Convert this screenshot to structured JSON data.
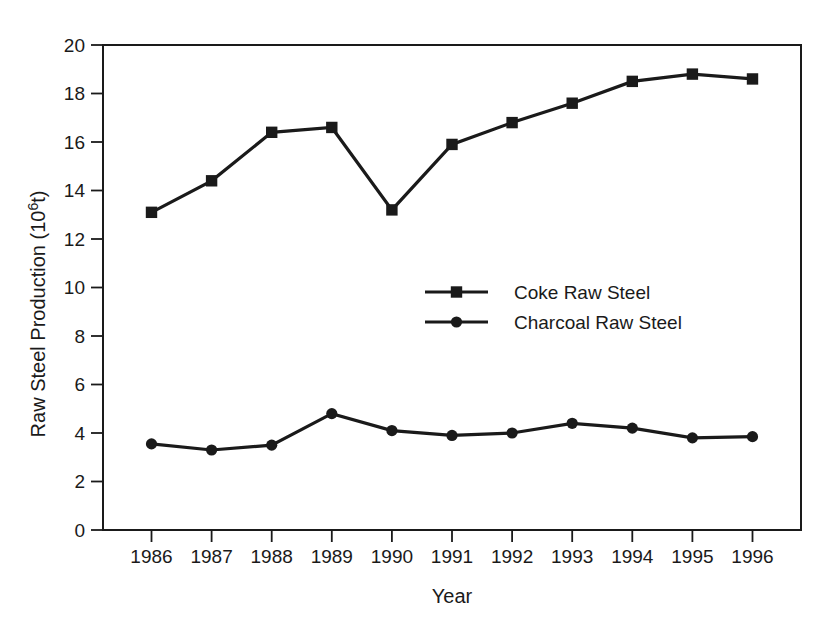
{
  "figure": {
    "background": "#ffffff",
    "ink_color": "#1a1a1a"
  },
  "chart_data": {
    "type": "line",
    "title": "",
    "xlabel": "Year",
    "ylabel": "Raw Steel Production (10^6t)",
    "ylabel_parts": {
      "prefix": "Raw Steel Production (10",
      "superscript": "6",
      "suffix": "t)"
    },
    "categories": [
      "1986",
      "1987",
      "1988",
      "1989",
      "1990",
      "1991",
      "1992",
      "1993",
      "1994",
      "1995",
      "1996"
    ],
    "yticks": [
      "0",
      "2",
      "4",
      "6",
      "8",
      "10",
      "12",
      "14",
      "16",
      "18",
      "20"
    ],
    "ylim": [
      0,
      20
    ],
    "grid": false,
    "legend_position": "inside-center-right",
    "series": [
      {
        "name": "Coke Raw Steel",
        "marker": "square",
        "color": "#1a1a1a",
        "values": [
          13.1,
          14.4,
          16.4,
          16.6,
          13.2,
          15.9,
          16.8,
          17.6,
          18.5,
          18.8,
          18.6
        ]
      },
      {
        "name": "Charcoal Raw Steel",
        "marker": "circle",
        "color": "#1a1a1a",
        "values": [
          3.55,
          3.3,
          3.5,
          4.8,
          4.1,
          3.9,
          4.0,
          4.4,
          4.2,
          3.8,
          3.85
        ]
      }
    ]
  }
}
